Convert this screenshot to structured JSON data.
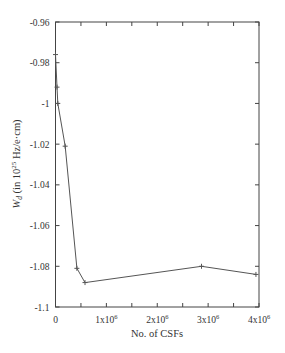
{
  "chart_data": {
    "type": "line",
    "title": "",
    "xlabel": "No.  of CSFs",
    "ylabel": "W_d (in 10^25 Hz/e·cm)",
    "ylabel_parts": {
      "symbol": "W",
      "subscript": "d",
      "pre": " (in 10",
      "exp": "25",
      "post": " Hz/e·cm)"
    },
    "xlim": [
      0,
      4000000
    ],
    "ylim": [
      -1.1,
      -0.96
    ],
    "x_ticks": [
      0,
      1000000,
      2000000,
      3000000,
      4000000
    ],
    "x_tick_labels": [
      {
        "base": "0",
        "exp": ""
      },
      {
        "base": "1x10",
        "exp": "6"
      },
      {
        "base": "2x10",
        "exp": "6"
      },
      {
        "base": "3x10",
        "exp": "6"
      },
      {
        "base": "4x10",
        "exp": "6"
      }
    ],
    "x_minor_ticks": [
      500000,
      1500000,
      2500000,
      3500000
    ],
    "y_ticks": [
      -0.96,
      -0.98,
      -1.0,
      -1.02,
      -1.04,
      -1.06,
      -1.08,
      -1.1
    ],
    "y_tick_labels": [
      "-0.96",
      "-0.98",
      "-1",
      "-1.02",
      "-1.04",
      "-1.06",
      "-1.08",
      "-1.1"
    ],
    "grid": false,
    "legend": null,
    "series": [
      {
        "name": "W_d",
        "marker": "+",
        "color": "#555555",
        "x": [
          0,
          30000,
          45000,
          190000,
          420000,
          580000,
          2870000,
          3940000
        ],
        "y": [
          -0.976,
          -0.992,
          -1.0,
          -1.021,
          -1.081,
          -1.088,
          -1.08,
          -1.084
        ]
      }
    ]
  },
  "colors": {
    "axis": "#444444",
    "line": "#555555",
    "text": "#333333"
  }
}
